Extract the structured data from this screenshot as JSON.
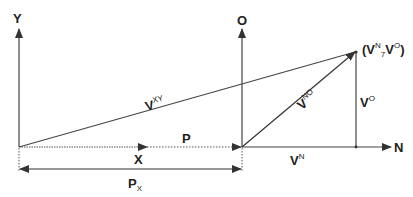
{
  "diagram": {
    "axes": {
      "y_axis_label": "Y",
      "o_axis_label": "O",
      "n_axis_label": "N",
      "x_vector_label": "X"
    },
    "vectors": {
      "vxy": {
        "base": "V",
        "sup": "XY"
      },
      "vno": {
        "base": "V",
        "sup": "NO"
      },
      "vo": {
        "base": "V",
        "sup": "O"
      },
      "vn": {
        "base": "V",
        "sup": "N"
      },
      "p": {
        "base": "P"
      }
    },
    "point_label": {
      "open": "(",
      "v1": "V",
      "v1_sup": "N",
      "sep": ",",
      "sep_sub": "7",
      "v2": "V",
      "v2_sup": "O",
      "close": ")"
    },
    "dimension": {
      "base": "P",
      "sub": "X"
    },
    "colors": {
      "line": "#333333",
      "text": "#222222"
    }
  }
}
